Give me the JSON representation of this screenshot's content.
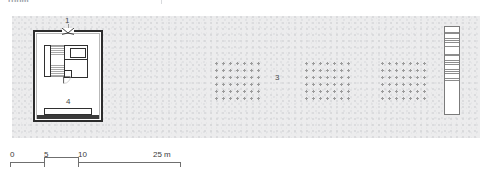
{
  "figure": {
    "type": "architectural-site-plan",
    "top_caption": "room",
    "background_color": "#ffffff",
    "site": {
      "fill_color": "#ececed",
      "stipple_color": "#d2d3d5",
      "description": "stippled ground / site area"
    },
    "callouts": [
      {
        "id": "1",
        "label": "1",
        "refers_to": "entrance",
        "x": 65,
        "y": 16
      },
      {
        "id": "2",
        "label": "2",
        "refers_to": "banded strip element at east edge",
        "x": 448,
        "y": 27
      },
      {
        "id": "3",
        "label": "3",
        "refers_to": "orchard / planted tree grids",
        "x": 275,
        "y": 73
      },
      {
        "id": "4",
        "label": "4",
        "refers_to": "courtyard",
        "x": 66,
        "y": 97
      }
    ],
    "building": {
      "wall_color": "#2c2c2c",
      "interior_fill": "#ffffff",
      "entrance_symbol": "door-swing-bowtie"
    },
    "orchard_grids": [
      {
        "name": "grid-a",
        "columns": 7,
        "rows": 7
      },
      {
        "name": "grid-b",
        "columns": 7,
        "rows": 7
      },
      {
        "name": "grid-c",
        "columns": 7,
        "rows": 7
      }
    ],
    "strip_element": {
      "label": "2",
      "bands": 2,
      "hatch_color": "#8d8d8d",
      "border_color": "#7b7b7b"
    }
  },
  "scale_bar": {
    "unit": "m",
    "ticks": [
      {
        "label": "0",
        "value": 0
      },
      {
        "label": "5",
        "value": 5
      },
      {
        "label": "10",
        "value": 10
      },
      {
        "label": "25 m",
        "value": 25
      }
    ],
    "line_color": "#6f6f6f",
    "text_color": "#3b3b3b"
  }
}
